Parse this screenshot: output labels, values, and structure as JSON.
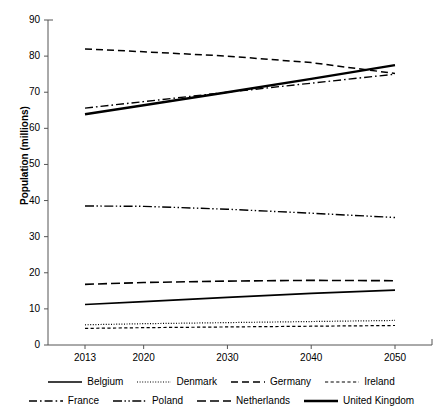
{
  "chart_data": {
    "type": "line",
    "title": "",
    "subtitle": "",
    "xlabel": "",
    "ylabel": "Population (millions)",
    "x": [
      2013,
      2020,
      2030,
      2040,
      2050
    ],
    "xticklabels": [
      "2013",
      "2020",
      "2030",
      "2040",
      "2050"
    ],
    "yticklabels": [
      "0",
      "10",
      "20",
      "30",
      "40",
      "50",
      "60",
      "70",
      "80",
      "90"
    ],
    "yticks": [
      0,
      10,
      20,
      30,
      40,
      50,
      60,
      70,
      80,
      90
    ],
    "ylim": [
      0,
      90
    ],
    "xlim": [
      2013,
      2050
    ],
    "grid": false,
    "legend_position": "bottom",
    "series": [
      {
        "name": "Belgium",
        "style": "solid",
        "width": 1.6,
        "color": "#000000",
        "values": [
          11.2,
          12.0,
          13.2,
          14.3,
          15.2
        ]
      },
      {
        "name": "Denmark",
        "style": "dotted",
        "width": 1.2,
        "color": "#000000",
        "values": [
          5.6,
          5.9,
          6.2,
          6.5,
          6.8
        ]
      },
      {
        "name": "Germany",
        "style": "dashed",
        "width": 1.5,
        "color": "#000000",
        "values": [
          82.0,
          81.2,
          80.0,
          78.2,
          75.2
        ]
      },
      {
        "name": "Ireland",
        "style": "short-dashed",
        "width": 1.2,
        "color": "#000000",
        "values": [
          4.6,
          4.8,
          5.0,
          5.2,
          5.4
        ]
      },
      {
        "name": "France",
        "style": "dash-dot",
        "width": 1.4,
        "color": "#000000",
        "values": [
          65.6,
          67.4,
          70.0,
          72.5,
          75.0
        ]
      },
      {
        "name": "Poland",
        "style": "dash-dot-dot",
        "width": 1.4,
        "color": "#000000",
        "values": [
          38.5,
          38.4,
          37.6,
          36.5,
          35.3
        ]
      },
      {
        "name": "Netherlands",
        "style": "long-dashed",
        "width": 1.6,
        "color": "#000000",
        "values": [
          16.8,
          17.3,
          17.7,
          17.9,
          17.8
        ]
      },
      {
        "name": "United Kingdom",
        "style": "solid-thick",
        "width": 2.4,
        "color": "#000000",
        "values": [
          63.9,
          66.4,
          70.0,
          73.7,
          77.5
        ]
      }
    ]
  },
  "axis": {
    "y_label": "Population (millions)",
    "y_ticks": [
      "90",
      "80",
      "70",
      "60",
      "50",
      "40",
      "30",
      "20",
      "10",
      "0"
    ],
    "x_ticks": [
      "2013",
      "2020",
      "2030",
      "2040",
      "2050"
    ]
  },
  "legend": {
    "row1": [
      {
        "label": "Belgium",
        "style": "solid"
      },
      {
        "label": "Denmark",
        "style": "dotted"
      },
      {
        "label": "Germany",
        "style": "dashed"
      },
      {
        "label": "Ireland",
        "style": "short-dashed"
      }
    ],
    "row2": [
      {
        "label": "France",
        "style": "dash-dot"
      },
      {
        "label": "Poland",
        "style": "dash-dot-dot"
      },
      {
        "label": "Netherlands",
        "style": "long-dashed"
      },
      {
        "label": "United Kingdom",
        "style": "solid-thick"
      }
    ]
  }
}
